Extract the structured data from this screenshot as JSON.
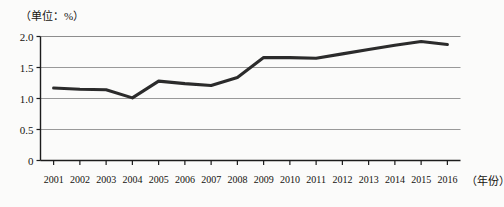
{
  "chart_data": {
    "type": "line",
    "title": "",
    "unit_note": "（单位：%）",
    "xlabel": "（年份）",
    "ylabel": "",
    "categories": [
      "2001",
      "2002",
      "2003",
      "2004",
      "2005",
      "2006",
      "2007",
      "2008",
      "2009",
      "2010",
      "2011",
      "2012",
      "2013",
      "2014",
      "2015",
      "2016"
    ],
    "values": [
      1.17,
      1.15,
      1.14,
      1.01,
      1.28,
      1.24,
      1.21,
      1.34,
      1.66,
      1.66,
      1.65,
      1.72,
      1.79,
      1.86,
      1.92,
      1.87
    ],
    "series": [
      {
        "name": "",
        "values": [
          1.17,
          1.15,
          1.14,
          1.01,
          1.28,
          1.24,
          1.21,
          1.34,
          1.66,
          1.66,
          1.65,
          1.72,
          1.79,
          1.86,
          1.92,
          1.87
        ]
      }
    ],
    "ylim": [
      0,
      2.0
    ],
    "yticks": [
      0,
      0.5,
      1.0,
      1.5,
      2.0
    ],
    "ytick_labels": [
      "0",
      "0.5",
      "1.0",
      "1.5",
      "2.0"
    ],
    "grid": true,
    "grid_axis": "y",
    "legend": false,
    "legend_position": "none",
    "line_color": "#2b2b2b",
    "grid_color": "#8d8d8d",
    "axis_color": "#1c1c1c",
    "background_color": "#fbfbfa"
  }
}
